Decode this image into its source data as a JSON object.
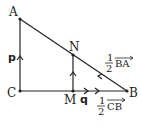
{
  "points": {
    "A": {
      "label": "A",
      "x": 20,
      "y": 19
    },
    "B": {
      "label": "B",
      "x": 127,
      "y": 91
    },
    "C": {
      "label": "C",
      "x": 20,
      "y": 91
    },
    "M": {
      "label": "M",
      "x": 73,
      "y": 91
    },
    "N": {
      "label": "N",
      "x": 73,
      "y": 55
    }
  },
  "vectors": {
    "p": "p",
    "q": "q",
    "half_BA": {
      "num": "1",
      "den": "2",
      "vec": "BA"
    },
    "half_CB": {
      "num": "1",
      "den": "2",
      "vec": "CB"
    }
  },
  "colors": {
    "line": "#222222",
    "background": "#ffffff"
  }
}
